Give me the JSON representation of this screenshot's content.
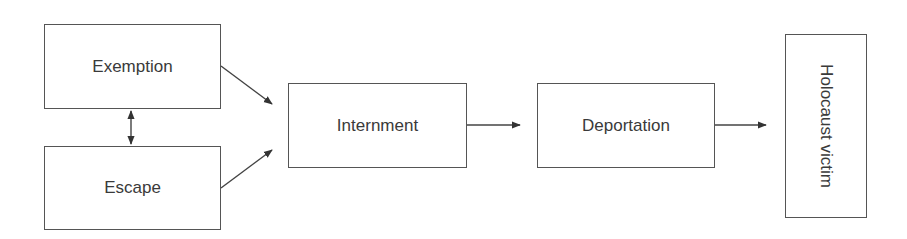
{
  "diagram": {
    "type": "flowchart",
    "nodes": [
      {
        "id": "exemption",
        "label": "Exemption"
      },
      {
        "id": "escape",
        "label": "Escape"
      },
      {
        "id": "internment",
        "label": "Internment"
      },
      {
        "id": "deportation",
        "label": "Deportation"
      },
      {
        "id": "victim",
        "label": "Holocaust victim",
        "orientation": "vertical"
      }
    ],
    "edges": [
      {
        "from": "exemption",
        "to": "escape",
        "direction": "bidirectional"
      },
      {
        "from": "exemption",
        "to": "internment",
        "direction": "forward"
      },
      {
        "from": "escape",
        "to": "internment",
        "direction": "forward"
      },
      {
        "from": "internment",
        "to": "deportation",
        "direction": "forward"
      },
      {
        "from": "deportation",
        "to": "victim",
        "direction": "forward"
      }
    ],
    "colors": {
      "stroke": "#555555",
      "text": "#3a3a3a",
      "background": "#ffffff"
    }
  }
}
